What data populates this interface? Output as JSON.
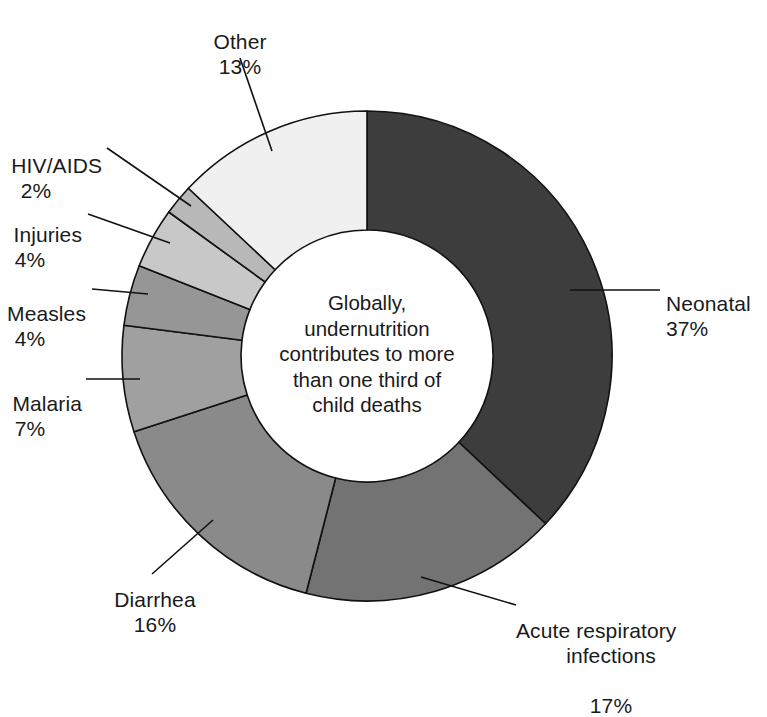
{
  "chart_data": {
    "type": "pie",
    "variant": "donut",
    "title": "",
    "subtitle": "",
    "xlabel": "",
    "ylabel": "",
    "units": "percent",
    "total": 100,
    "legend_position": "none-callout-labels",
    "grid": false,
    "center_annotation": [
      "Globally,",
      "undernutrition",
      "contributes to more",
      "than one third of",
      "child deaths"
    ],
    "center_annotation_text": "Globally, undernutrition contributes to more than one third of child deaths",
    "categories": [
      "Neonatal",
      "Acute respiratory infections",
      "Diarrhea",
      "Malaria",
      "Measles",
      "Injuries",
      "HIV/AIDS",
      "Other"
    ],
    "values": [
      37,
      17,
      16,
      7,
      4,
      4,
      2,
      13
    ],
    "labels": [
      "37%",
      "17%",
      "16%",
      "7%",
      "4%",
      "4%",
      "2%",
      "13%"
    ],
    "colors": [
      "#3d3d3d",
      "#737373",
      "#8a8a8a",
      "#a0a0a0",
      "#969696",
      "#c8c8c8",
      "#b8b8b8",
      "#f0f0f0"
    ],
    "slices": [
      {
        "name": "Neonatal",
        "value": 37,
        "label": "37%",
        "color": "#3d3d3d"
      },
      {
        "name": "Acute respiratory infections",
        "value": 17,
        "label": "17%",
        "color": "#737373"
      },
      {
        "name": "Diarrhea",
        "value": 16,
        "label": "16%",
        "color": "#8a8a8a"
      },
      {
        "name": "Malaria",
        "value": 7,
        "label": "7%",
        "color": "#a0a0a0"
      },
      {
        "name": "Measles",
        "value": 4,
        "label": "4%",
        "color": "#969696"
      },
      {
        "name": "Injuries",
        "value": 4,
        "label": "4%",
        "color": "#c8c8c8"
      },
      {
        "name": "HIV/AIDS",
        "value": 2,
        "label": "2%",
        "color": "#b8b8b8"
      },
      {
        "name": "Other",
        "value": 13,
        "label": "13%",
        "color": "#f0f0f0"
      }
    ]
  },
  "callouts": {
    "neonatal": {
      "name": "Neonatal",
      "pct": "37%"
    },
    "acute": {
      "name": "Acute respiratory",
      "name2": "infections",
      "pct": "17%"
    },
    "diarrhea": {
      "name": "Diarrhea",
      "pct": "16%"
    },
    "malaria": {
      "name": "Malaria",
      "pct": "7%"
    },
    "measles": {
      "name": "Measles",
      "pct": "4%"
    },
    "injuries": {
      "name": "Injuries",
      "pct": "4%"
    },
    "hivaids": {
      "name": "HIV/AIDS",
      "pct": "2%"
    },
    "other": {
      "name": "Other",
      "pct": "13%"
    }
  },
  "center": {
    "line1": "Globally,",
    "line2": "undernutrition",
    "line3": "contributes to more",
    "line4": "than one third of",
    "line5": "child deaths"
  },
  "style": {
    "stroke": "#111111",
    "background": "#ffffff"
  }
}
